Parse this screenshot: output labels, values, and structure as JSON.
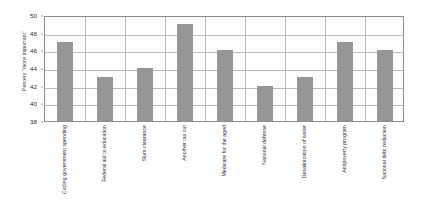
{
  "chart_data": {
    "type": "bar",
    "title": "",
    "xlabel": "",
    "ylabel": "Percent \"more important\"",
    "ylim": [
      38,
      50
    ],
    "ytick_step": 2,
    "yticks": [
      38,
      40,
      42,
      44,
      46,
      48,
      50
    ],
    "ytick_labels": [
      "38",
      "40",
      "42",
      "44",
      "46",
      "48",
      "50"
    ],
    "grid": "both",
    "legend": "none",
    "bar_color": "#969696",
    "grid_color": "#b9b9b9",
    "axis_color": "#8c8c8c",
    "categories": [
      "Cutting government spending",
      "Federal aid to education",
      "Slum clearance",
      "Another tax cut",
      "Medicare for the aged",
      "National defense",
      "Desalinization of water",
      "Antipoverty program",
      "National debt reduction"
    ],
    "values": [
      47,
      43,
      44,
      49,
      46,
      42,
      43,
      47,
      46
    ]
  }
}
